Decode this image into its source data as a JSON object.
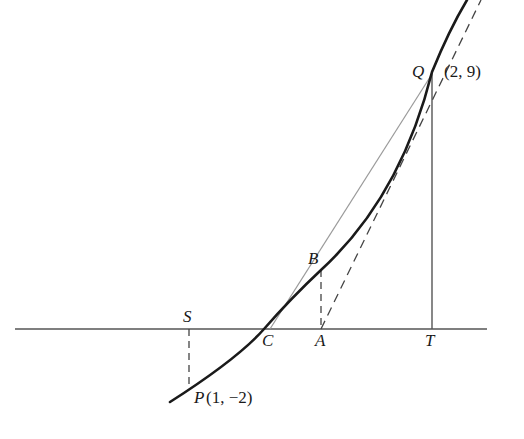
{
  "figure": {
    "colors": {
      "curve": "#1a1a1a",
      "axis": "#555555",
      "dashed": "#444444",
      "chord": "#9a9a9a",
      "text": "#1a1a1a"
    }
  },
  "points": {
    "Q": {
      "label": "Q",
      "coords": "(2, 9)"
    },
    "P": {
      "label": "P",
      "coords": "(1, −2)"
    },
    "B": {
      "label": "B"
    },
    "S": {
      "label": "S"
    },
    "C": {
      "label": "C"
    },
    "A": {
      "label": "A"
    },
    "T": {
      "label": "T"
    }
  }
}
